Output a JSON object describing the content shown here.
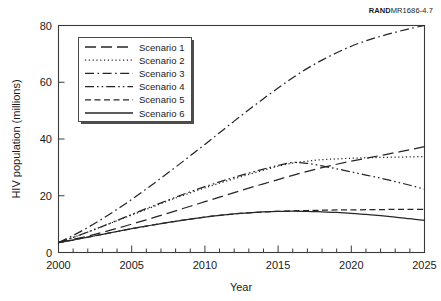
{
  "figure_tag": {
    "brand": "RAND",
    "code": "MR1686-4.7"
  },
  "chart_data": {
    "type": "line",
    "title": "",
    "subtitle": "",
    "xlabel": "Year",
    "ylabel": "HIV population (millions)",
    "xlim": [
      2000,
      2025
    ],
    "ylim": [
      0,
      80
    ],
    "xticks": [
      2000,
      2005,
      2010,
      2015,
      2020,
      2025
    ],
    "xtick_labels": [
      "2000",
      "2005",
      "2010",
      "2015",
      "2020",
      "2025"
    ],
    "yticks": [
      0,
      20,
      40,
      60,
      80
    ],
    "ytick_labels": [
      "0",
      "20",
      "40",
      "60",
      "80"
    ],
    "minor_xtick_interval": 1,
    "grid": false,
    "legend_position": "upper-left",
    "x": [
      2000,
      2001,
      2002,
      2003,
      2004,
      2005,
      2006,
      2007,
      2008,
      2009,
      2010,
      2011,
      2012,
      2013,
      2014,
      2015,
      2016,
      2017,
      2018,
      2019,
      2020,
      2021,
      2022,
      2023,
      2024,
      2025
    ],
    "series": [
      {
        "name": "Scenario 1",
        "dash": "long-dash",
        "values": [
          3.5,
          4.6,
          5.8,
          7.1,
          8.5,
          10.0,
          11.5,
          13.1,
          14.7,
          16.3,
          17.9,
          19.5,
          21.1,
          22.7,
          24.2,
          25.7,
          27.2,
          28.6,
          29.9,
          31.1,
          32.2,
          33.2,
          34.2,
          35.2,
          36.2,
          37.3
        ]
      },
      {
        "name": "Scenario 2",
        "dash": "dotted",
        "values": [
          3.5,
          5.3,
          7.2,
          9.2,
          11.2,
          13.2,
          15.2,
          17.2,
          19.2,
          21.0,
          22.8,
          24.4,
          26.0,
          27.5,
          29.0,
          30.4,
          31.5,
          32.2,
          32.7,
          33.0,
          33.2,
          33.4,
          33.5,
          33.6,
          33.7,
          33.8
        ]
      },
      {
        "name": "Scenario 3",
        "dash": "dash-dot",
        "values": [
          3.5,
          6.0,
          8.8,
          11.9,
          15.2,
          18.7,
          22.4,
          26.2,
          30.1,
          34.1,
          38.1,
          42.2,
          46.3,
          50.3,
          54.2,
          58.0,
          61.6,
          64.9,
          67.8,
          70.4,
          72.7,
          74.6,
          76.2,
          77.6,
          78.9,
          80.0
        ]
      },
      {
        "name": "Scenario 4",
        "dash": "dash-dot-dot",
        "values": [
          3.5,
          5.3,
          7.2,
          9.2,
          11.3,
          13.4,
          15.5,
          17.5,
          19.5,
          21.4,
          23.2,
          24.9,
          26.5,
          28.0,
          29.4,
          30.7,
          31.7,
          31.4,
          30.5,
          29.5,
          28.4,
          27.3,
          26.2,
          25.0,
          23.7,
          22.3
        ]
      },
      {
        "name": "Scenario 5",
        "dash": "dash",
        "values": [
          3.5,
          4.4,
          5.4,
          6.4,
          7.4,
          8.4,
          9.3,
          10.2,
          11.0,
          11.8,
          12.5,
          13.1,
          13.6,
          14.0,
          14.3,
          14.5,
          14.7,
          14.8,
          14.9,
          15.0,
          15.0,
          15.1,
          15.1,
          15.2,
          15.2,
          15.2
        ]
      },
      {
        "name": "Scenario 6",
        "dash": "solid",
        "values": [
          3.5,
          4.4,
          5.4,
          6.4,
          7.4,
          8.4,
          9.3,
          10.2,
          11.0,
          11.8,
          12.5,
          13.1,
          13.6,
          14.0,
          14.3,
          14.5,
          14.6,
          14.5,
          14.3,
          14.1,
          13.8,
          13.4,
          13.0,
          12.5,
          11.9,
          11.3
        ]
      }
    ]
  }
}
